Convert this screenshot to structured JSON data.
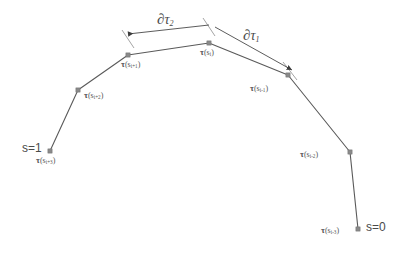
{
  "figure": {
    "type": "diagram",
    "background_color": "#ffffff",
    "line_color": "#5a5a5a",
    "node_color": "#8a8a8a",
    "text_color": "#4a4a4a"
  },
  "endpoints": [
    {
      "name": "s-equals-one",
      "label": "s=1",
      "x": 22,
      "y": 142
    },
    {
      "name": "s-equals-zero",
      "label": "s=0",
      "x": 366,
      "y": 221
    }
  ],
  "measures": [
    {
      "name": "partial-tau-2",
      "symbol": "∂",
      "tau": "τ",
      "subscript": "2",
      "x": 157,
      "y": 12
    },
    {
      "name": "partial-tau-1",
      "symbol": "∂",
      "tau": "τ",
      "subscript": "1",
      "x": 243,
      "y": 28
    }
  ],
  "nodes": [
    {
      "name": "node-i-plus-3",
      "tau": "τ",
      "arg_open": "(s",
      "subscript": "i+3",
      "arg_close": ")",
      "cx": 50,
      "cy": 151,
      "label_x": 36,
      "label_y": 156
    },
    {
      "name": "node-i-plus-2",
      "tau": "τ",
      "arg_open": "(s",
      "subscript": "i+2",
      "arg_close": ")",
      "cx": 78,
      "cy": 90,
      "label_x": 84,
      "label_y": 91
    },
    {
      "name": "node-i-plus-1",
      "tau": "τ",
      "arg_open": "(s",
      "subscript": "i+1",
      "arg_close": ")",
      "cx": 128,
      "cy": 55,
      "label_x": 121,
      "label_y": 60
    },
    {
      "name": "node-i",
      "tau": "τ",
      "arg_open": "(s",
      "subscript": "i",
      "arg_close": ")",
      "cx": 209,
      "cy": 43,
      "label_x": 200,
      "label_y": 48
    },
    {
      "name": "node-i-minus-1",
      "tau": "τ",
      "arg_open": "(s",
      "subscript": "i-1",
      "arg_close": ")",
      "cx": 288,
      "cy": 75,
      "label_x": 250,
      "label_y": 84
    },
    {
      "name": "node-i-minus-2",
      "tau": "τ",
      "arg_open": "(s",
      "subscript": "i-2",
      "arg_close": ")",
      "cx": 350,
      "cy": 152,
      "label_x": 300,
      "label_y": 150
    },
    {
      "name": "node-i-minus-3",
      "tau": "τ",
      "arg_open": "(s",
      "subscript": "i-3",
      "arg_close": ")",
      "cx": 358,
      "cy": 229,
      "label_x": 321,
      "label_y": 226
    }
  ],
  "curve": {
    "name": "discretized-curve",
    "points": "50,151 78,90 128,55 209,43 288,75 350,152 358,229"
  },
  "measure_arrows": [
    {
      "name": "partial-tau-2-arrow",
      "from_x": 209,
      "from_y": 25,
      "to_x": 128,
      "to_y": 34
    },
    {
      "name": "partial-tau-1-arrow",
      "from_x": 215,
      "from_y": 27,
      "to_x": 292,
      "to_y": 70
    }
  ],
  "tick_marks": [
    {
      "name": "tick-at-node-i-plus-1",
      "x1": 122,
      "y1": 30,
      "x2": 134,
      "y2": 48
    },
    {
      "name": "tick-at-node-i-upper",
      "x1": 203,
      "y1": 18,
      "x2": 215,
      "y2": 36
    },
    {
      "name": "tick-at-node-i-minus-1",
      "x1": 283,
      "y1": 62,
      "x2": 297,
      "y2": 80
    }
  ]
}
